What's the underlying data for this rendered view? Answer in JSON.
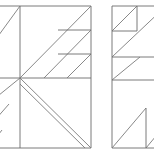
{
  "figure": {
    "title": "",
    "background_color": "#ffffff",
    "stroke_color": "#6b6b6b",
    "diagonal_color": "#7a7a7a",
    "stroke_width": 0.9,
    "canvas": {
      "width": 154,
      "height": 155
    },
    "panels": [
      {
        "name": "left-panel",
        "label": "",
        "frame": {
          "x": -12,
          "y": 6,
          "width": 103,
          "height": 142
        },
        "interior_vertical_x": 20,
        "interior_horizontal_y": 78,
        "quadrants": [
          {
            "name": "upper-left-quadrant",
            "pattern": "single-diagonal-up-right",
            "lines": [
              {
                "x1": -12,
                "y1": 50,
                "x2": 20,
                "y2": 6
              }
            ]
          },
          {
            "name": "upper-right-quadrant",
            "pattern": "staircase-three-diagonals-with-horizontals",
            "lines": [
              {
                "x1": 20,
                "y1": 78,
                "x2": 91,
                "y2": 6
              },
              {
                "x1": 44,
                "y1": 78,
                "x2": 91,
                "y2": 30
              },
              {
                "x1": 67,
                "y1": 78,
                "x2": 91,
                "y2": 54
              }
            ],
            "horizontals": [
              {
                "x1": 58,
                "y1": 30,
                "x2": 91,
                "y2": 30
              },
              {
                "x1": 58,
                "y1": 54,
                "x2": 91,
                "y2": 54
              }
            ]
          },
          {
            "name": "lower-left-quadrant",
            "pattern": "three-parallel-diagonals-up-right",
            "lines": [
              {
                "x1": -12,
                "y1": 104,
                "x2": 20,
                "y2": 78
              },
              {
                "x1": -12,
                "y1": 128,
                "x2": 9,
                "y2": 104
              },
              {
                "x1": -12,
                "y1": 148,
                "x2": 2,
                "y2": 130
              }
            ]
          },
          {
            "name": "lower-right-quadrant",
            "pattern": "two-parallel-diagonals-down-right",
            "lines": [
              {
                "x1": 20,
                "y1": 78,
                "x2": 91,
                "y2": 148
              },
              {
                "x1": 20,
                "y1": 84,
                "x2": 85,
                "y2": 148
              }
            ]
          }
        ]
      },
      {
        "name": "right-panel",
        "label": "",
        "frame": {
          "x": 112,
          "y": 6,
          "width": 54,
          "height": 142
        },
        "interior_vertical_x": 146,
        "sections": [
          {
            "name": "top-section",
            "pattern": "diagonal-in-small-box",
            "lines": [
              {
                "x1": 112,
                "y1": 31,
                "x2": 137,
                "y2": 6
              }
            ],
            "horizontals": [
              {
                "x1": 112,
                "y1": 31,
                "x2": 137,
                "y2": 31
              }
            ],
            "verticals": [
              {
                "x1": 137,
                "y1": 6,
                "x2": 137,
                "y2": 31
              }
            ]
          },
          {
            "name": "second-section",
            "pattern": "long-diagonal",
            "lines": [
              {
                "x1": 112,
                "y1": 57,
                "x2": 166,
                "y2": 6
              }
            ],
            "horizontals": [
              {
                "x1": 112,
                "y1": 57,
                "x2": 166,
                "y2": 57
              }
            ]
          },
          {
            "name": "third-section",
            "pattern": "diagonal-with-step",
            "lines": [
              {
                "x1": 112,
                "y1": 80,
                "x2": 140,
                "y2": 57
              }
            ],
            "horizontals": [
              {
                "x1": 112,
                "y1": 80,
                "x2": 166,
                "y2": 80
              }
            ]
          },
          {
            "name": "bottom-section",
            "pattern": "two-diagonals-up-right",
            "lines": [
              {
                "x1": 112,
                "y1": 148,
                "x2": 146,
                "y2": 108
              },
              {
                "x1": 146,
                "y1": 148,
                "x2": 166,
                "y2": 124
              }
            ],
            "verticals": [
              {
                "x1": 146,
                "y1": 108,
                "x2": 146,
                "y2": 148
              }
            ]
          }
        ]
      }
    ]
  }
}
